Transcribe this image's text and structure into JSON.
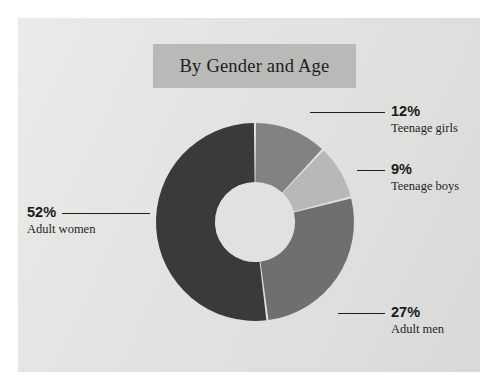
{
  "page": {
    "background_color": "#ffffff",
    "panel_color": "#e2e2e0"
  },
  "title": {
    "text": "By Gender and Age",
    "band_color": "#b9b9b7"
  },
  "chart_data": {
    "type": "pie",
    "variant": "donut",
    "title": "By Gender and Age",
    "categories": [
      "Teenage girls",
      "Teenage boys",
      "Adult men",
      "Adult women"
    ],
    "values": [
      12,
      9,
      27,
      52
    ],
    "value_labels": [
      "12%",
      "9%",
      "27%",
      "52%"
    ],
    "unit": "percent",
    "total": 100,
    "start_angle_deg": 0,
    "direction": "clockwise",
    "inner_radius_ratio": 0.405,
    "slice_colors": [
      "#828282",
      "#b8b8b8",
      "#6f6f6f",
      "#3a3a3a"
    ],
    "separator_color": "#e2e2e0",
    "legend": "none (direct labels with leader lines)",
    "grid": false,
    "slices": [
      {
        "label": "Teenage girls",
        "value": 12,
        "display": "12%",
        "color": "#828282"
      },
      {
        "label": "Teenage boys",
        "value": 9,
        "display": "9%",
        "color": "#b8b8b8"
      },
      {
        "label": "Adult men",
        "value": 27,
        "display": "27%",
        "color": "#6f6f6f"
      },
      {
        "label": "Adult women",
        "value": 52,
        "display": "52%",
        "color": "#3a3a3a"
      }
    ]
  },
  "callouts": [
    {
      "pct": "12%",
      "cat": "Teenage girls"
    },
    {
      "pct": "9%",
      "cat": "Teenage boys"
    },
    {
      "pct": "27%",
      "cat": "Adult men"
    },
    {
      "pct": "52%",
      "cat": "Adult women"
    }
  ]
}
